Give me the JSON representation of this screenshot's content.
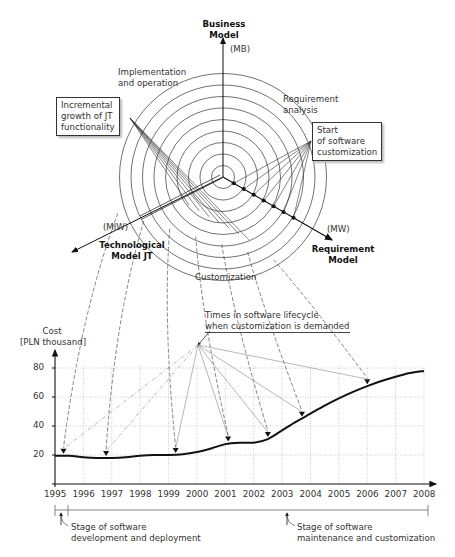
{
  "polar": {
    "axes": {
      "business": {
        "title_line1": "Business",
        "title_line2": "Model",
        "abbr": "(MB)"
      },
      "technological": {
        "title_line1": "Technological",
        "title_line2": "Model JT",
        "abbr": "(MIW)"
      },
      "requirement": {
        "title_line1": "Requirement",
        "title_line2": "Model",
        "abbr": "(MW)"
      }
    },
    "sector_labels": {
      "implementation_l1": "Implementation",
      "implementation_l2": "and operation",
      "requirement_l1": "Requirement",
      "requirement_l2": "analysis",
      "customization": "Customization"
    },
    "callouts": {
      "left_l1": "Incremental",
      "left_l2": "growth of JT",
      "left_l3": "functionality",
      "right_l1": "Start",
      "right_l2": "of software",
      "right_l3": "customization"
    },
    "rings": 9
  },
  "chart_annotation": {
    "line1": "Times in software lifecycle",
    "line2": "when customization is demanded"
  },
  "chart_data": {
    "type": "line",
    "title": "",
    "xlabel": "",
    "ylabel": "Cost [PLN thousand]",
    "ylabel_l1": "Cost",
    "ylabel_l2": "[PLN thousand]",
    "x": [
      1995,
      1995.5,
      1996,
      1996.5,
      1997,
      1997.5,
      1998,
      1998.5,
      1999,
      1999.5,
      2000,
      2000.5,
      2001,
      2001.5,
      2002,
      2002.5,
      2003,
      2003.5,
      2004,
      2004.5,
      2005,
      2005.5,
      2006,
      2006.5,
      2007,
      2007.5,
      2008
    ],
    "values": [
      19.5,
      19.5,
      18.5,
      18,
      18,
      18.5,
      19.5,
      20,
      20,
      20.5,
      22,
      24.5,
      27.5,
      28.5,
      28.5,
      31,
      37,
      43,
      48.5,
      54,
      59,
      63.5,
      67.5,
      71,
      74,
      76.5,
      78
    ],
    "markers": [
      {
        "x": 1995.3,
        "y": 19.5
      },
      {
        "x": 1996.8,
        "y": 18
      },
      {
        "x": 1999.25,
        "y": 20
      },
      {
        "x": 2001.1,
        "y": 28
      },
      {
        "x": 2002.5,
        "y": 31
      },
      {
        "x": 2003.7,
        "y": 45
      },
      {
        "x": 2006,
        "y": 67.5
      }
    ],
    "x_ticks": [
      "1995",
      "1996",
      "1997",
      "1998",
      "1999",
      "2000",
      "2001",
      "2002",
      "2003",
      "2004",
      "2005",
      "2006",
      "2007",
      "2008"
    ],
    "y_ticks": [
      "20",
      "40",
      "60",
      "80"
    ],
    "xlim": [
      1995,
      2008
    ],
    "ylim": [
      0,
      90
    ],
    "grid": true,
    "legend": "none"
  },
  "stages": {
    "dev_l1": "Stage of software",
    "dev_l2": "development and deployment",
    "maint_l1": "Stage of software",
    "maint_l2": "maintenance and customization"
  }
}
